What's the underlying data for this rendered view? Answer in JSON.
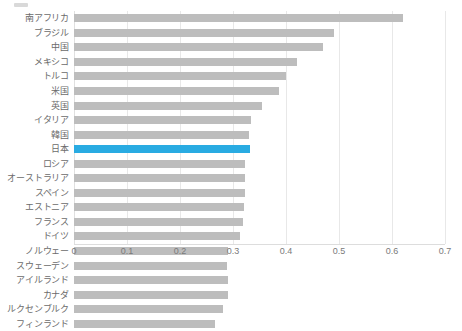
{
  "chart_data": {
    "type": "bar",
    "orientation": "horizontal",
    "title": "",
    "subtitle": "",
    "xlabel": "",
    "ylabel": "",
    "xlim": [
      0,
      0.7
    ],
    "ylim": null,
    "grid": true,
    "legend": false,
    "legend_position": "none",
    "x_ticks": [
      "0",
      "0.1",
      "0.2",
      "0.3",
      "0.4",
      "0.5",
      "0.6",
      "0.7"
    ],
    "x_tick_values": [
      0,
      0.1,
      0.2,
      0.3,
      0.4,
      0.5,
      0.6,
      0.7
    ],
    "categories": [
      "南アフリカ",
      "ブラジル",
      "中国",
      "メキシコ",
      "トルコ",
      "米国",
      "英国",
      "イタリア",
      "韓国",
      "日本",
      "ロシア",
      "オーストラリア",
      "スペイン",
      "エストニア",
      "フランス",
      "ドイツ",
      "ノルウェー",
      "スウェーデン",
      "アイルランド",
      "カナダ",
      "ルクセンブルク",
      "フィンランド"
    ],
    "values": [
      0.62,
      0.49,
      0.47,
      0.42,
      0.4,
      0.387,
      0.355,
      0.334,
      0.331,
      0.332,
      0.323,
      0.322,
      0.322,
      0.321,
      0.319,
      0.313,
      0.291,
      0.289,
      0.29,
      0.29,
      0.281,
      0.266
    ],
    "highlight_category": "日本",
    "colors": {
      "bar": "#bdbdbd",
      "highlight": "#29abe2",
      "grid": "#e8e8e8",
      "axis": "#dddddd",
      "label": "#6b6b6b",
      "tick": "#7a7a7a"
    }
  }
}
